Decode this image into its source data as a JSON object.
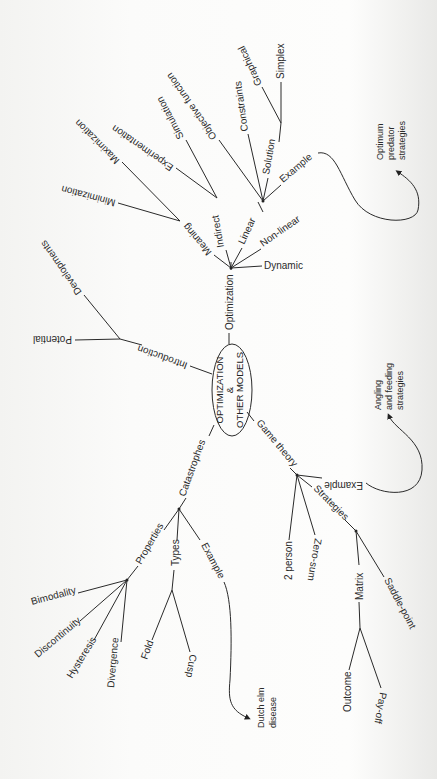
{
  "central": {
    "line1": "OPTIMIZATION",
    "line2": "&",
    "line3": "OTHER MODELS"
  },
  "branches": {
    "optimization": {
      "label": "Optimization",
      "meaning": {
        "label": "Meaning",
        "children": [
          "Minimization",
          "Maximization"
        ]
      },
      "indirect": {
        "label": "Indirect",
        "children": [
          "Experimentation",
          "Simulation"
        ]
      },
      "linear": {
        "label": "Linear",
        "objective": "Objective function",
        "constraints": "Constraints",
        "solution": {
          "label": "Solution",
          "children": [
            "Graphical",
            "Simplex"
          ]
        },
        "example": "Example",
        "example_target": [
          "Optimum",
          "predator",
          "strategies"
        ]
      },
      "non_linear": "Non-linear",
      "dynamic": "Dynamic"
    },
    "introduction": {
      "label": "Introduction",
      "children": [
        "Developments",
        "Potential"
      ]
    },
    "catastrophes": {
      "label": "Catastrophes",
      "properties": {
        "label": "Properties",
        "children": [
          "Bimodality",
          "Discontinuity",
          "Hysteresis",
          "Divergence"
        ]
      },
      "types": {
        "label": "Types",
        "children": [
          "Fold",
          "Cusp"
        ]
      },
      "example": "Example",
      "example_target": [
        "Dutch elm",
        "disease"
      ]
    },
    "game_theory": {
      "label": "Game theory",
      "example": "Example",
      "example_target": [
        "Angling",
        "and feeding",
        "strategies"
      ],
      "two_person": "2 person",
      "zero_sum": "Zero-sum",
      "strategies": {
        "label": "Strategies",
        "matrix": {
          "label": "Matrix",
          "children": [
            "Outcome",
            "Pay-off"
          ]
        },
        "saddle": "Saddle-point"
      }
    }
  }
}
